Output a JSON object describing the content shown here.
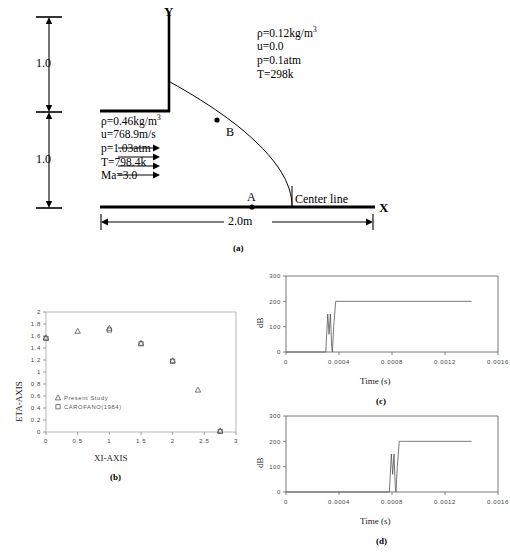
{
  "figure": {
    "panel_a": {
      "caption": "(a)",
      "axis_labels": {
        "y": "Y",
        "x": "X"
      },
      "point_labels": {
        "interior": "B",
        "centerline": "A"
      },
      "centerline_label": "Center line",
      "dimensions": {
        "upper_height": "1.0",
        "lower_height": "1.0",
        "length": "2.0m"
      },
      "upper_state": {
        "title": "ambient-state",
        "lines": [
          {
            "sym": "ρ",
            "eq": "=0.12kg/m",
            "sup": "3"
          },
          {
            "sym": "u",
            "eq": "=0.0",
            "sup": ""
          },
          {
            "sym": "p",
            "eq": "=0.1atm",
            "sup": ""
          },
          {
            "sym": "T",
            "eq": "=298k",
            "sup": ""
          }
        ]
      },
      "inlet_state": {
        "title": "inlet-state",
        "lines": [
          {
            "sym": "ρ",
            "eq": "=0.46kg/m",
            "sup": "3"
          },
          {
            "sym": "u",
            "eq": "=768.9m/s",
            "sup": ""
          },
          {
            "sym": "p",
            "eq": "=1.03atm",
            "sup": ""
          },
          {
            "sym": "T",
            "eq": "=798.4k",
            "sup": ""
          },
          {
            "sym": "Ma",
            "eq": "=3.0",
            "sup": ""
          }
        ]
      }
    },
    "panel_b": {
      "caption": "(b)"
    },
    "panel_c": {
      "caption": "(c)"
    },
    "panel_d": {
      "caption": "(d)"
    }
  },
  "chart_data": [
    {
      "id": "b",
      "type": "scatter",
      "title": "",
      "xlabel": "XI-AXIS",
      "ylabel": "ETA-AXIS",
      "xlim": [
        0,
        3
      ],
      "ylim": [
        0,
        2
      ],
      "xticks": [
        "0",
        "0.5",
        "1",
        "1.5",
        "2",
        "2.5",
        "3"
      ],
      "xtick_values": [
        0,
        0.5,
        1,
        1.5,
        2,
        2.5,
        3
      ],
      "yticks": [
        "0",
        "0.2",
        "0.4",
        "0.6",
        "0.8",
        "1",
        "1.2",
        "1.4",
        "1.6",
        "1.8",
        "2"
      ],
      "ytick_values": [
        0,
        0.2,
        0.4,
        0.6,
        0.8,
        1,
        1.2,
        1.4,
        1.6,
        1.8,
        2
      ],
      "grid": false,
      "legend_position": "inside-lower-left",
      "series": [
        {
          "name": "Present Study",
          "marker": "triangle",
          "x": [
            0,
            0.5,
            1.0,
            1.5,
            2.0,
            2.4,
            2.75
          ],
          "y": [
            1.57,
            1.68,
            1.73,
            1.48,
            1.19,
            0.7,
            0.02
          ]
        },
        {
          "name": "CAROFANO(1984)",
          "marker": "square",
          "x": [
            0,
            1.0,
            1.5,
            2.0,
            2.75
          ],
          "y": [
            1.56,
            1.7,
            1.47,
            1.18,
            0.01
          ]
        }
      ]
    },
    {
      "id": "c",
      "type": "line",
      "title": "",
      "xlabel": "Time (s)",
      "ylabel": "dB",
      "xlim": [
        0,
        0.0016
      ],
      "ylim": [
        0,
        300
      ],
      "xticks": [
        "0",
        "0.0004",
        "0.0008",
        "0.0012",
        "0.0016"
      ],
      "xtick_values": [
        0,
        0.0004,
        0.0008,
        0.0012,
        0.0016
      ],
      "yticks": [
        "0",
        "100",
        "200",
        "300"
      ],
      "ytick_values": [
        0,
        100,
        200,
        300
      ],
      "grid": false,
      "series": [
        {
          "name": "probe-A",
          "x": [
            0,
            0.0003,
            0.000315,
            0.000325,
            0.000335,
            0.000345,
            0.00035,
            0.00036,
            0.000375,
            0.0004,
            0.0014
          ],
          "y": [
            0,
            0,
            150,
            70,
            150,
            20,
            0,
            100,
            200,
            200,
            200
          ]
        }
      ]
    },
    {
      "id": "d",
      "type": "line",
      "title": "",
      "xlabel": "Time (s)",
      "ylabel": "dB",
      "xlim": [
        0,
        0.0016
      ],
      "ylim": [
        0,
        300
      ],
      "xticks": [
        "0",
        "0.0004",
        "0.0008",
        "0.0012",
        "0.0016"
      ],
      "xtick_values": [
        0,
        0.0004,
        0.0008,
        0.0012,
        0.0016
      ],
      "yticks": [
        "0",
        "100",
        "200",
        "300"
      ],
      "ytick_values": [
        0,
        100,
        200,
        300
      ],
      "grid": false,
      "series": [
        {
          "name": "probe-B",
          "x": [
            0,
            0.00078,
            0.000795,
            0.000805,
            0.000815,
            0.000825,
            0.00083,
            0.00084,
            0.000855,
            0.00088,
            0.0014
          ],
          "y": [
            0,
            0,
            150,
            70,
            150,
            20,
            0,
            100,
            200,
            200,
            200
          ]
        }
      ]
    }
  ]
}
